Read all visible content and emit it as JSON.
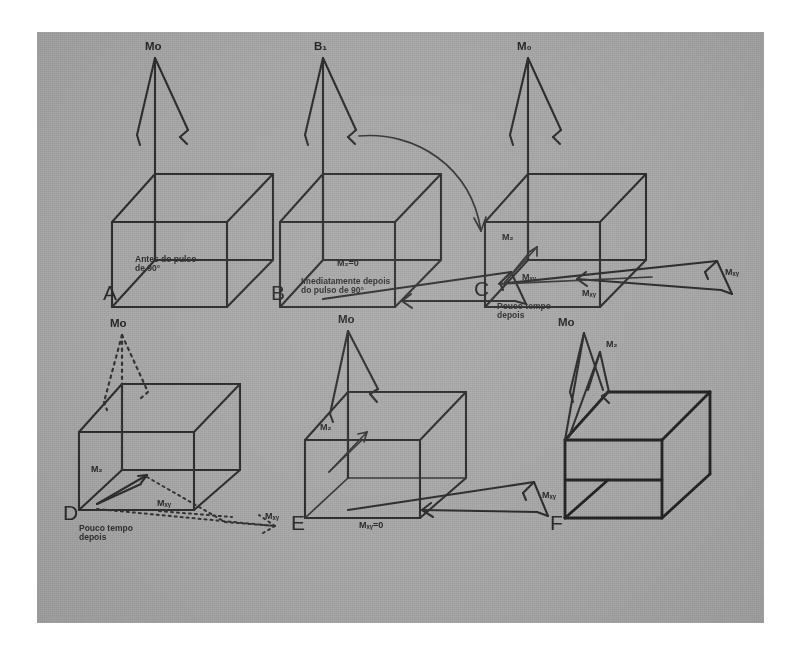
{
  "figure": {
    "language": "pt-BR",
    "background_color": "#a6a6a6",
    "ink_color": "#2a2a2a",
    "page_color": "#ffffff",
    "panel_count": 6
  },
  "panels": [
    {
      "id": "A",
      "letter": "A",
      "caption_line1": "Antes do pulso",
      "caption_line2": "de 90°",
      "labels": {
        "m0": "Mo"
      }
    },
    {
      "id": "B",
      "letter": "B",
      "caption_line1": "Imediatamente depois",
      "caption_line2": "do pulso de 90°",
      "labels": {
        "b1": "B₁",
        "mz": "M₂=0",
        "mxy": "Mₓᵧ"
      }
    },
    {
      "id": "C",
      "letter": "C",
      "caption_line1": "Pouco tempo",
      "caption_line2": "depois",
      "labels": {
        "m0": "M₀",
        "mz": "M₂",
        "mxy1": "Mₓᵧ",
        "mxy2": "Mₓᵧ"
      }
    },
    {
      "id": "D",
      "letter": "D",
      "caption_line1": "Pouco tempo",
      "caption_line2": "depois",
      "labels": {
        "m0": "Mo",
        "mz": "M₂",
        "mxy1": "Mₓᵧ",
        "mxy2": "Mₓᵧ"
      }
    },
    {
      "id": "E",
      "letter": "E",
      "caption_line1": "",
      "caption_line2": "",
      "labels": {
        "m0": "Mo",
        "mz": "M₂",
        "mxy_zero": "Mₓᵧ=0",
        "mxy": "Mₓᵧ"
      }
    },
    {
      "id": "F",
      "letter": "F",
      "caption_line1": "",
      "caption_line2": "",
      "labels": {
        "m0": "Mo",
        "mz": "M₂"
      }
    }
  ]
}
